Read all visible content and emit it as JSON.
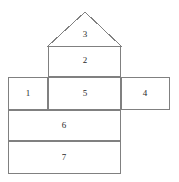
{
  "figure": {
    "kind": "geometric-net-diagram",
    "canvas": {
      "width": 179,
      "height": 182
    },
    "stroke_color": "#808080",
    "background_color": "#ffffff",
    "label_color": "#2a2a2a",
    "stroke_width": 1
  },
  "faces": [
    {
      "label": "1",
      "shape": "rectangle",
      "x": 8,
      "y": 77,
      "width": 40,
      "height": 33,
      "label_x": 28,
      "label_y": 93
    },
    {
      "label": "2",
      "shape": "rectangle",
      "x": 48,
      "y": 46,
      "width": 73,
      "height": 31,
      "label_x": 85,
      "label_y": 60
    },
    {
      "label": "3",
      "shape": "triangle",
      "apex_x": 85,
      "apex_y": 12,
      "base_left_x": 48,
      "base_left_y": 46,
      "base_right_x": 121,
      "base_right_y": 46,
      "label_x": 85,
      "label_y": 34
    },
    {
      "label": "4",
      "shape": "rectangle",
      "x": 121,
      "y": 77,
      "width": 49,
      "height": 33,
      "label_x": 145,
      "label_y": 93
    },
    {
      "label": "5",
      "shape": "rectangle",
      "x": 48,
      "y": 77,
      "width": 73,
      "height": 33,
      "label_x": 85,
      "label_y": 93
    },
    {
      "label": "6",
      "shape": "rectangle",
      "x": 8,
      "y": 110,
      "width": 113,
      "height": 31,
      "label_x": 64,
      "label_y": 125
    },
    {
      "label": "7",
      "shape": "rectangle",
      "x": 8,
      "y": 141,
      "width": 113,
      "height": 33,
      "label_x": 64,
      "label_y": 157
    }
  ]
}
